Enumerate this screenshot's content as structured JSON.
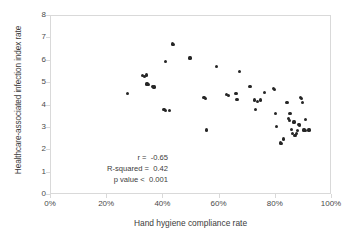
{
  "chart_data": {
    "type": "scatter",
    "title": "",
    "xlabel": "Hand hygiene compliance rate",
    "ylabel": "Healthcare-associated infection index rate",
    "xlim": [
      0,
      100
    ],
    "ylim": [
      0,
      8
    ],
    "xtick_labels": [
      "0%",
      "20%",
      "40%",
      "60%",
      "80%",
      "100%"
    ],
    "xtick_values": [
      0,
      20,
      40,
      60,
      80,
      100
    ],
    "ytick_labels": [
      "0",
      "1",
      "2",
      "3",
      "4",
      "5",
      "6",
      "7",
      "8"
    ],
    "ytick_values": [
      0,
      1,
      2,
      3,
      4,
      5,
      6,
      7,
      8
    ],
    "grid": false,
    "legend": null,
    "marker": {
      "shape": "circle",
      "color": "#262626",
      "size": 3.2
    },
    "series": [
      {
        "name": "hospitals",
        "points": [
          [
            27.5,
            4.48
          ],
          [
            32.8,
            5.3
          ],
          [
            33.6,
            5.24
          ],
          [
            34.2,
            5.32
          ],
          [
            34.5,
            4.92
          ],
          [
            35.0,
            4.88
          ],
          [
            36.4,
            4.8
          ],
          [
            37.0,
            4.78
          ],
          [
            40.6,
            3.78
          ],
          [
            41.2,
            3.74
          ],
          [
            41.0,
            5.93
          ],
          [
            42.4,
            3.72
          ],
          [
            43.6,
            6.7
          ],
          [
            44.0,
            6.68
          ],
          [
            49.8,
            6.08
          ],
          [
            54.8,
            4.3
          ],
          [
            55.4,
            4.26
          ],
          [
            55.8,
            2.86
          ],
          [
            59.2,
            5.7
          ],
          [
            62.8,
            4.44
          ],
          [
            63.4,
            4.4
          ],
          [
            66.2,
            4.48
          ],
          [
            66.4,
            4.22
          ],
          [
            66.8,
            4.24
          ],
          [
            67.4,
            5.48
          ],
          [
            71.2,
            4.8
          ],
          [
            72.8,
            4.2
          ],
          [
            73.2,
            3.78
          ],
          [
            73.8,
            4.14
          ],
          [
            75.0,
            4.2
          ],
          [
            76.2,
            4.52
          ],
          [
            79.4,
            4.7
          ],
          [
            79.8,
            4.66
          ],
          [
            80.2,
            3.58
          ],
          [
            80.6,
            3.02
          ],
          [
            82.0,
            2.28
          ],
          [
            82.4,
            2.24
          ],
          [
            83.2,
            2.46
          ],
          [
            84.2,
            4.1
          ],
          [
            84.6,
            4.08
          ],
          [
            84.8,
            3.38
          ],
          [
            85.2,
            3.3
          ],
          [
            85.4,
            3.6
          ],
          [
            86.0,
            2.9
          ],
          [
            86.4,
            2.72
          ],
          [
            86.8,
            3.22
          ],
          [
            87.2,
            2.62
          ],
          [
            87.6,
            2.7
          ],
          [
            88.0,
            2.84
          ],
          [
            88.6,
            3.1
          ],
          [
            88.8,
            3.06
          ],
          [
            89.2,
            4.32
          ],
          [
            89.6,
            4.28
          ],
          [
            89.8,
            4.1
          ],
          [
            90.4,
            2.86
          ],
          [
            90.8,
            2.84
          ],
          [
            91.0,
            3.32
          ],
          [
            92.2,
            2.86
          ]
        ]
      }
    ],
    "annotations": {
      "r_label": "r =  -0.65",
      "rsquared_label": "R-squared =  0.42",
      "pvalue_label": "p value <  0.001",
      "r": -0.65,
      "r_squared": 0.42,
      "p_value": "< 0.001"
    }
  }
}
